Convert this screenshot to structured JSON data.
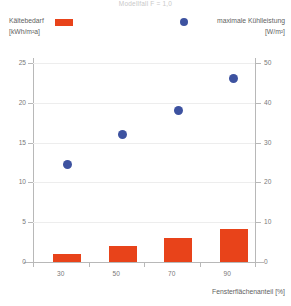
{
  "title": "Modellfall F = 1,0",
  "legend": {
    "left": {
      "label": "Kältebedarf",
      "unit": "[kWh/m²a]",
      "color": "#E8431A",
      "marker": "square"
    },
    "right": {
      "label": "maximale Kühlleistung",
      "unit": "[W/m²]",
      "color": "#3D52A0",
      "marker": "circle"
    }
  },
  "axes": {
    "x_title": "Fensterflächenanteil [%]",
    "x_ticks": [
      "30",
      "50",
      "70",
      "90"
    ],
    "y_left_ticks": [
      "0",
      "5",
      "10",
      "15",
      "20",
      "25"
    ],
    "y_right_ticks": [
      "0",
      "10",
      "20",
      "30",
      "40",
      "50"
    ]
  },
  "chart_data": {
    "type": "bar",
    "title": "Modellfall F = 1,0",
    "xlabel": "Fensterflächenanteil [%]",
    "ylabel": "Kältebedarf [kWh/m²a]",
    "y2label": "maximale Kühlleistung [W/m²]",
    "categories": [
      "30",
      "50",
      "70",
      "90"
    ],
    "ylim": [
      0,
      25
    ],
    "y2lim": [
      0,
      50
    ],
    "yticks": [
      0,
      5,
      10,
      15,
      20,
      25
    ],
    "y2ticks": [
      0,
      10,
      20,
      30,
      40,
      50
    ],
    "grid": true,
    "legend_position": "top",
    "series": [
      {
        "name": "Kältebedarf",
        "type": "bar",
        "axis": "left",
        "unit": "kWh/m²a",
        "color": "#E8431A",
        "values": [
          1.0,
          2.0,
          3.0,
          4.1
        ]
      },
      {
        "name": "maximale Kühlleistung",
        "type": "scatter",
        "axis": "right",
        "unit": "W/m²",
        "color": "#3D52A0",
        "values": [
          24.5,
          32.0,
          38.0,
          46.0
        ]
      }
    ]
  }
}
